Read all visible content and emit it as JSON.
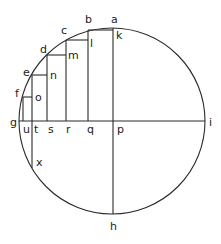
{
  "diagram": {
    "stroke_color": "#2a2a2a",
    "circle": {
      "cx": 112,
      "cy": 121,
      "r": 93
    },
    "segments": [
      {
        "id": "g-i",
        "x1": 19,
        "y1": 121,
        "x2": 205,
        "y2": 121
      },
      {
        "id": "a-h",
        "x1": 113,
        "y1": 28,
        "x2": 113,
        "y2": 214
      },
      {
        "id": "u-f",
        "x1": 23,
        "y1": 121,
        "x2": 23,
        "y2": 97
      },
      {
        "id": "f-o",
        "x1": 23,
        "y1": 97,
        "x2": 32,
        "y2": 97
      },
      {
        "id": "x-e",
        "x1": 32,
        "y1": 168,
        "x2": 32,
        "y2": 75
      },
      {
        "id": "e-n",
        "x1": 32,
        "y1": 75,
        "x2": 47,
        "y2": 75
      },
      {
        "id": "s-d",
        "x1": 47,
        "y1": 121,
        "x2": 47,
        "y2": 55
      },
      {
        "id": "d-m",
        "x1": 47,
        "y1": 55,
        "x2": 66,
        "y2": 55
      },
      {
        "id": "r-c",
        "x1": 66,
        "y1": 121,
        "x2": 66,
        "y2": 40
      },
      {
        "id": "c-l",
        "x1": 66,
        "y1": 40,
        "x2": 88,
        "y2": 40
      },
      {
        "id": "q-b",
        "x1": 88,
        "y1": 121,
        "x2": 88,
        "y2": 30
      },
      {
        "id": "b-k",
        "x1": 88,
        "y1": 30,
        "x2": 113,
        "y2": 30
      }
    ],
    "labels": [
      {
        "text": "a",
        "x": 111,
        "y": 23
      },
      {
        "text": "b",
        "x": 85,
        "y": 23
      },
      {
        "text": "c",
        "x": 61,
        "y": 34
      },
      {
        "text": "d",
        "x": 40,
        "y": 53
      },
      {
        "text": "e",
        "x": 23,
        "y": 76
      },
      {
        "text": "f",
        "x": 15,
        "y": 97
      },
      {
        "text": "g",
        "x": 10,
        "y": 126
      },
      {
        "text": "u",
        "x": 23,
        "y": 133
      },
      {
        "text": "t",
        "x": 34,
        "y": 133
      },
      {
        "text": "s",
        "x": 48,
        "y": 133
      },
      {
        "text": "r",
        "x": 66,
        "y": 133
      },
      {
        "text": "q",
        "x": 87,
        "y": 133
      },
      {
        "text": "p",
        "x": 117,
        "y": 133
      },
      {
        "text": "i",
        "x": 209,
        "y": 126
      },
      {
        "text": "h",
        "x": 110,
        "y": 230
      },
      {
        "text": "k",
        "x": 116,
        "y": 39
      },
      {
        "text": "l",
        "x": 90,
        "y": 47
      },
      {
        "text": "m",
        "x": 68,
        "y": 59
      },
      {
        "text": "n",
        "x": 50,
        "y": 79
      },
      {
        "text": "o",
        "x": 35,
        "y": 101
      },
      {
        "text": "x",
        "x": 36,
        "y": 166
      }
    ]
  }
}
